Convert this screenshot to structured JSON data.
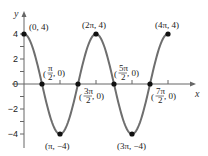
{
  "chart_data": {
    "type": "line",
    "title": "",
    "function": "y = 4cos(x)",
    "xlabel": "x",
    "ylabel": "y",
    "xlim": [
      0,
      12.566
    ],
    "ylim": [
      -4,
      4
    ],
    "grid": false,
    "legend": null,
    "y_tick_labels": [
      "4",
      "2",
      "0",
      "−2",
      "−4"
    ],
    "y_ticks": [
      4,
      2,
      0,
      -2,
      -4
    ],
    "series": [
      {
        "name": "curve",
        "color": "#6e6e6e",
        "x": [
          0,
          1.5708,
          3.1416,
          4.7124,
          6.2832,
          7.854,
          9.4248,
          10.9956,
          12.5664
        ],
        "y": [
          4,
          0,
          -4,
          0,
          4,
          0,
          -4,
          0,
          4
        ]
      }
    ],
    "points": [
      {
        "label_main": "(0, 4)",
        "x": 0,
        "y": 4
      },
      {
        "label_num": "π",
        "label_den": "2",
        "label_main": "(π/2, 0)",
        "x": 1.5708,
        "y": 0
      },
      {
        "label_main": "(π, −4)",
        "x": 3.1416,
        "y": -4
      },
      {
        "label_num": "3π",
        "label_den": "2",
        "label_main": "(3π/2, 0)",
        "x": 4.7124,
        "y": 0
      },
      {
        "label_main": "(2π, 4)",
        "x": 6.2832,
        "y": 4
      },
      {
        "label_num": "5π",
        "label_den": "2",
        "label_main": "(5π/2, 0)",
        "x": 7.854,
        "y": 0
      },
      {
        "label_main": "(3π, −4)",
        "x": 9.4248,
        "y": -4
      },
      {
        "label_num": "7π",
        "label_den": "2",
        "label_main": "(7π/2, 0)",
        "x": 10.9956,
        "y": 0
      },
      {
        "label_main": "(4π, 4)",
        "x": 12.5664,
        "y": 4
      }
    ],
    "annotations": {
      "p0": "(0, 4)",
      "p2": "(π, −4)",
      "p4": "(2π, 4)",
      "p6": "(3π, −4)",
      "p8": "(4π, 4)",
      "frac_open": "(",
      "frac_close": ", 0)",
      "n1": "π",
      "d1": "2",
      "n3": "3π",
      "d3": "2",
      "n5": "5π",
      "d5": "2",
      "n7": "7π",
      "d7": "2"
    }
  }
}
